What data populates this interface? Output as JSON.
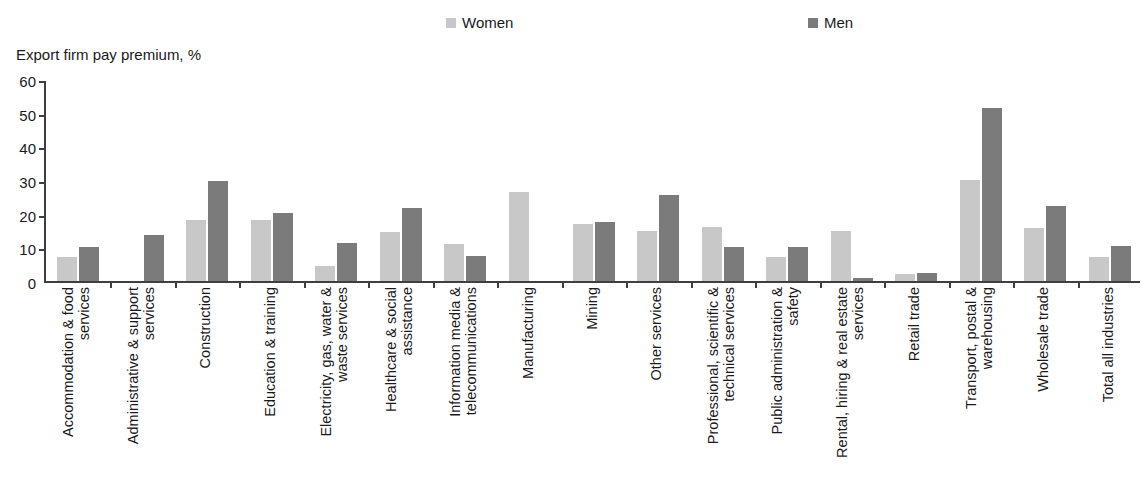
{
  "legend": {
    "entries": [
      {
        "label": "Women",
        "color": "#c8c8c8",
        "key": "women"
      },
      {
        "label": "Men",
        "color": "#7b7b7b",
        "key": "men"
      }
    ]
  },
  "axis": {
    "y_title": "Export firm pay premium, %",
    "y_ticks": [
      "60",
      "50",
      "40",
      "30",
      "20",
      "10",
      "0"
    ]
  },
  "chart_data": {
    "type": "bar",
    "title": "",
    "subtitle": "",
    "xlabel": "",
    "ylabel": "Export firm pay premium, %",
    "ylim": [
      0,
      60
    ],
    "ytick_values": [
      0,
      10,
      20,
      30,
      40,
      50,
      60
    ],
    "grid": false,
    "legend_position": "top",
    "orientation": "vertical",
    "grouping": "clustered",
    "categories": [
      "Accommodation & food services",
      "Administrative & support services",
      "Construction",
      "Education & training",
      "Electricity, gas, water & waste services",
      "Healthcare & social assistance",
      "Information media & telecommunications",
      "Manufacturing",
      "Mining",
      "Other services",
      "Professional, scientific & technical services",
      "Public administration & safety",
      "Rental, hiring & real estate services",
      "Retail trade",
      "Transport, postal & warehousing",
      "Wholesale trade",
      "Total all industries"
    ],
    "category_lines": [
      [
        "Accommodation & food",
        "services"
      ],
      [
        "Administrative & support",
        "services"
      ],
      [
        "Construction"
      ],
      [
        "Education & training"
      ],
      [
        "Electricity, gas, water &",
        "waste services"
      ],
      [
        "Healthcare & social",
        "assistance"
      ],
      [
        "Information media &",
        "telecommunications"
      ],
      [
        "Manufacturing"
      ],
      [
        "Mining"
      ],
      [
        "Other services"
      ],
      [
        "Professional, scientific &",
        "technical services"
      ],
      [
        "Public administration &",
        "safety"
      ],
      [
        "Rental, hiring & real estate",
        "services"
      ],
      [
        "Retail trade"
      ],
      [
        "Transport, postal &",
        "warehousing"
      ],
      [
        "Wholesale trade"
      ],
      [
        "Total all industries"
      ]
    ],
    "series": [
      {
        "name": "Women",
        "color": "#c8c8c8",
        "values": [
          7.0,
          0.0,
          18.0,
          18.0,
          4.5,
          14.5,
          11.0,
          26.5,
          17.0,
          15.0,
          16.0,
          7.0,
          15.0,
          2.0,
          30.0,
          15.8,
          7.0
        ]
      },
      {
        "name": "Men",
        "color": "#7b7b7b",
        "values": [
          10.0,
          13.8,
          29.7,
          20.2,
          11.2,
          21.8,
          7.5,
          0.0,
          17.6,
          25.5,
          10.0,
          10.0,
          0.9,
          2.3,
          51.3,
          22.4,
          10.5
        ]
      }
    ]
  }
}
